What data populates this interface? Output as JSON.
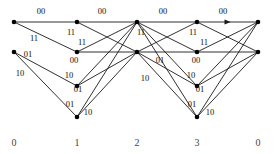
{
  "figure": {
    "width": 277,
    "height": 154,
    "background_color": "#ffffff",
    "line_color": "#1a1a1a",
    "node_color": "#000000",
    "label_color": "#111111",
    "stage_label_color": "#444444"
  },
  "stage_labels": [
    {
      "text": "0",
      "x": 14,
      "y": 146
    },
    {
      "text": "1",
      "x": 77,
      "y": 146
    },
    {
      "text": "2",
      "x": 137,
      "y": 146
    },
    {
      "text": "3",
      "x": 197,
      "y": 146
    },
    {
      "text": "0",
      "x": 258,
      "y": 146
    }
  ],
  "columns": [
    {
      "name": "column-0",
      "x": 14,
      "nodes": [
        {
          "id": "c0n0",
          "y": 22
        },
        {
          "id": "c0n1",
          "y": 52
        }
      ]
    },
    {
      "name": "column-1",
      "x": 77,
      "nodes": [
        {
          "id": "c1n0",
          "y": 22
        },
        {
          "id": "c1n1",
          "y": 52
        },
        {
          "id": "c1n2",
          "y": 86
        },
        {
          "id": "c1n3",
          "y": 117
        }
      ]
    },
    {
      "name": "column-2",
      "x": 137,
      "nodes": [
        {
          "id": "c2n0",
          "y": 22
        },
        {
          "id": "c2n1",
          "y": 52
        }
      ]
    },
    {
      "name": "column-3",
      "x": 197,
      "nodes": [
        {
          "id": "c3n0",
          "y": 22
        },
        {
          "id": "c3n1",
          "y": 52
        },
        {
          "id": "c3n2",
          "y": 86
        },
        {
          "id": "c3n3",
          "y": 117
        }
      ]
    },
    {
      "name": "column-4",
      "x": 258,
      "nodes": [
        {
          "id": "c4n0",
          "y": 22
        },
        {
          "id": "c4n1",
          "y": 52
        }
      ]
    }
  ],
  "edges": [
    {
      "id": "e01",
      "from": "c0n0",
      "to": "c1n0",
      "label": "00",
      "arrow": false
    },
    {
      "id": "e02",
      "from": "c0n0",
      "to": "c1n1",
      "label": "11",
      "arrow": false
    },
    {
      "id": "e03",
      "from": "c0n1",
      "to": "c1n2",
      "label": "01",
      "arrow": false
    },
    {
      "id": "e04",
      "from": "c0n1",
      "to": "c1n3",
      "label": "10",
      "arrow": false
    },
    {
      "id": "e11",
      "from": "c1n0",
      "to": "c2n0",
      "label": "00",
      "arrow": false
    },
    {
      "id": "e12",
      "from": "c1n0",
      "to": "c2n1",
      "label": "11",
      "arrow": false
    },
    {
      "id": "e13",
      "from": "c1n1",
      "to": "c2n0",
      "label": "11",
      "arrow": false
    },
    {
      "id": "e14",
      "from": "c1n1",
      "to": "c2n1",
      "label": "00",
      "arrow": false
    },
    {
      "id": "e15",
      "from": "c1n2",
      "to": "c2n0",
      "label": "10",
      "arrow": false
    },
    {
      "id": "e16",
      "from": "c1n2",
      "to": "c2n1",
      "label": "01",
      "arrow": false
    },
    {
      "id": "e17",
      "from": "c1n3",
      "to": "c2n0",
      "label": "01",
      "arrow": false
    },
    {
      "id": "e18",
      "from": "c1n3",
      "to": "c2n1",
      "label": "10",
      "arrow": false
    },
    {
      "id": "e21",
      "from": "c2n0",
      "to": "c3n0",
      "label": "00",
      "arrow": false
    },
    {
      "id": "e22",
      "from": "c2n0",
      "to": "c3n1",
      "label": "11",
      "arrow": false
    },
    {
      "id": "e23",
      "from": "c2n0",
      "to": "c3n2",
      "label": "",
      "arrow": false
    },
    {
      "id": "e24",
      "from": "c2n0",
      "to": "c3n3",
      "label": "",
      "arrow": false
    },
    {
      "id": "e25",
      "from": "c2n1",
      "to": "c3n0",
      "label": "",
      "arrow": false
    },
    {
      "id": "e26",
      "from": "c2n1",
      "to": "c3n1",
      "label": "01",
      "arrow": false
    },
    {
      "id": "e27",
      "from": "c2n1",
      "to": "c3n2",
      "label": "10",
      "arrow": false
    },
    {
      "id": "e28",
      "from": "c2n1",
      "to": "c3n3",
      "label": "",
      "arrow": false
    },
    {
      "id": "e31",
      "from": "c3n0",
      "to": "c4n0",
      "label": "00",
      "arrow": true
    },
    {
      "id": "e32",
      "from": "c3n0",
      "to": "c4n1",
      "label": "11",
      "arrow": false
    },
    {
      "id": "e33",
      "from": "c3n1",
      "to": "c4n0",
      "label": "11",
      "arrow": false
    },
    {
      "id": "e34",
      "from": "c3n1",
      "to": "c4n1",
      "label": "00",
      "arrow": false
    },
    {
      "id": "e35",
      "from": "c3n2",
      "to": "c4n0",
      "label": "10",
      "arrow": false
    },
    {
      "id": "e36",
      "from": "c3n2",
      "to": "c4n1",
      "label": "01",
      "arrow": false
    },
    {
      "id": "e37",
      "from": "c3n3",
      "to": "c4n0",
      "label": "01",
      "arrow": false
    },
    {
      "id": "e38",
      "from": "c3n3",
      "to": "c4n1",
      "label": "10",
      "arrow": false
    }
  ],
  "edge_labels": [
    {
      "id": "lab-00-a",
      "text": "00",
      "x": 41,
      "y": 14
    },
    {
      "id": "lab-00-b",
      "text": "00",
      "x": 102,
      "y": 14
    },
    {
      "id": "lab-00-c",
      "text": "00",
      "x": 163,
      "y": 14
    },
    {
      "id": "lab-00-d",
      "text": "00",
      "x": 223,
      "y": 14
    },
    {
      "id": "lab-11-l1",
      "text": "11",
      "x": 34,
      "y": 41
    },
    {
      "id": "lab-01-l1",
      "text": "01",
      "x": 28,
      "y": 57
    },
    {
      "id": "lab-10-l1",
      "text": "10",
      "x": 20,
      "y": 76
    },
    {
      "id": "lab-11-c1a",
      "text": "11",
      "x": 71,
      "y": 35
    },
    {
      "id": "lab-11-c1b",
      "text": "11",
      "x": 82,
      "y": 45
    },
    {
      "id": "lab-00-c1",
      "text": "00",
      "x": 74,
      "y": 63
    },
    {
      "id": "lab-10-c1",
      "text": "10",
      "x": 69,
      "y": 78
    },
    {
      "id": "lab-01-c1a",
      "text": "01",
      "x": 78,
      "y": 92
    },
    {
      "id": "lab-01-c1b",
      "text": "01",
      "x": 70,
      "y": 107
    },
    {
      "id": "lab-10-c1b",
      "text": "10",
      "x": 88,
      "y": 115
    },
    {
      "id": "lab-11-c2",
      "text": "11",
      "x": 141,
      "y": 35
    },
    {
      "id": "lab-01-c2",
      "text": "01",
      "x": 160,
      "y": 63
    },
    {
      "id": "lab-10-c2",
      "text": "10",
      "x": 145,
      "y": 81
    },
    {
      "id": "lab-11-c3a",
      "text": "11",
      "x": 193,
      "y": 35
    },
    {
      "id": "lab-11-c3b",
      "text": "11",
      "x": 204,
      "y": 45
    },
    {
      "id": "lab-00-c3",
      "text": "00",
      "x": 196,
      "y": 63
    },
    {
      "id": "lab-10-c3",
      "text": "10",
      "x": 191,
      "y": 78
    },
    {
      "id": "lab-01-c3a",
      "text": "01",
      "x": 200,
      "y": 92
    },
    {
      "id": "lab-01-c3b",
      "text": "01",
      "x": 192,
      "y": 107
    },
    {
      "id": "lab-10-c3b",
      "text": "10",
      "x": 210,
      "y": 115
    }
  ]
}
